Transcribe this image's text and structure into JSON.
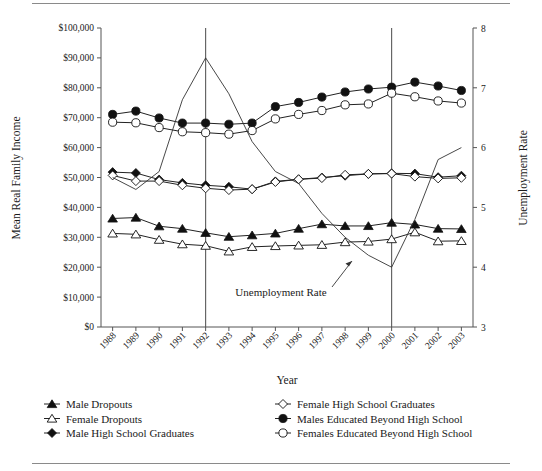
{
  "chart_data": {
    "type": "line",
    "title": "",
    "xlabel": "Year",
    "ylabel": "Mean Real Family Income",
    "y2label": "Unemployment Rate",
    "categories": [
      1988,
      1989,
      1990,
      1991,
      1992,
      1993,
      1994,
      1995,
      1996,
      1997,
      1998,
      1999,
      2000,
      2001,
      2002,
      2003
    ],
    "tick_labels_x": [
      "1988",
      "1989",
      "1990",
      "1991",
      "1992",
      "1993",
      "1994",
      "1995",
      "1996",
      "1997",
      "1998",
      "1999",
      "2000",
      "2001",
      "2002",
      "2003"
    ],
    "ylim": [
      0,
      100000
    ],
    "ytick_labels": [
      "$0",
      "$10,000",
      "$20,000",
      "$30,000",
      "$40,000",
      "$50,000",
      "$60,000",
      "$70,000",
      "$80,000",
      "$90,000",
      "$100,000"
    ],
    "yticks": [
      0,
      10000,
      20000,
      30000,
      40000,
      50000,
      60000,
      70000,
      80000,
      90000,
      100000
    ],
    "y2lim": [
      3,
      8
    ],
    "y2ticks": [
      3,
      4,
      5,
      6,
      7,
      8
    ],
    "y2tick_labels": [
      "3",
      "4",
      "5",
      "6",
      "7",
      "8"
    ],
    "grid": false,
    "legend_position": "below",
    "annotations": [
      {
        "text": "Unemployment Rate",
        "points_to_year": 1997
      }
    ],
    "reference_lines": [
      1992,
      2000
    ],
    "series": [
      {
        "name": "Male Dropouts",
        "marker": "filled-triangle",
        "axis": "left",
        "values": [
          36300,
          36600,
          33700,
          32900,
          31500,
          30200,
          30700,
          31300,
          32900,
          34400,
          33800,
          33800,
          34900,
          34300,
          32900,
          32800
        ]
      },
      {
        "name": "Female Dropouts",
        "marker": "open-triangle",
        "axis": "left",
        "values": [
          31300,
          31000,
          29200,
          27700,
          27200,
          25300,
          26800,
          27100,
          27300,
          27500,
          28400,
          28600,
          29400,
          31700,
          28700,
          28800
        ]
      },
      {
        "name": "Male High School Graduates",
        "marker": "filled-diamond",
        "axis": "left",
        "values": [
          51800,
          51500,
          49300,
          48200,
          47400,
          46900,
          46100,
          48700,
          49400,
          50000,
          50600,
          51200,
          51400,
          51300,
          50100,
          50600
        ]
      },
      {
        "name": "Female High School Graduates",
        "marker": "open-diamond",
        "axis": "left",
        "values": [
          50700,
          48800,
          48800,
          47400,
          46400,
          45800,
          46100,
          48500,
          49400,
          49800,
          50900,
          51200,
          51300,
          50300,
          49700,
          49900
        ]
      },
      {
        "name": "Males Educated Beyond High School",
        "marker": "filled-circle",
        "axis": "left",
        "values": [
          71100,
          72200,
          69900,
          68200,
          68200,
          67800,
          68200,
          73700,
          75100,
          76900,
          78600,
          79600,
          80200,
          81900,
          80600,
          79100
        ]
      },
      {
        "name": "Females Educated Beyond High School",
        "marker": "open-circle",
        "axis": "left",
        "values": [
          68500,
          68300,
          66700,
          65300,
          65000,
          64500,
          65700,
          69600,
          71100,
          72400,
          74300,
          74600,
          78200,
          77000,
          75600,
          74900
        ]
      },
      {
        "name": "Unemployment Rate",
        "marker": "none",
        "axis": "right",
        "values": [
          5.5,
          5.3,
          5.6,
          6.8,
          7.5,
          6.9,
          6.1,
          5.6,
          5.4,
          4.9,
          4.5,
          4.2,
          4.0,
          4.8,
          5.8,
          6.0
        ]
      }
    ]
  },
  "legend": {
    "col1": [
      {
        "label": "Male Dropouts",
        "marker": "filled-triangle"
      },
      {
        "label": "Female Dropouts",
        "marker": "open-triangle"
      },
      {
        "label": "Male High School Graduates",
        "marker": "filled-diamond"
      }
    ],
    "col2": [
      {
        "label": "Female High School Graduates",
        "marker": "open-diamond"
      },
      {
        "label": "Males Educated Beyond High School",
        "marker": "filled-circle"
      },
      {
        "label": "Females Educated Beyond High School",
        "marker": "open-circle"
      }
    ]
  }
}
